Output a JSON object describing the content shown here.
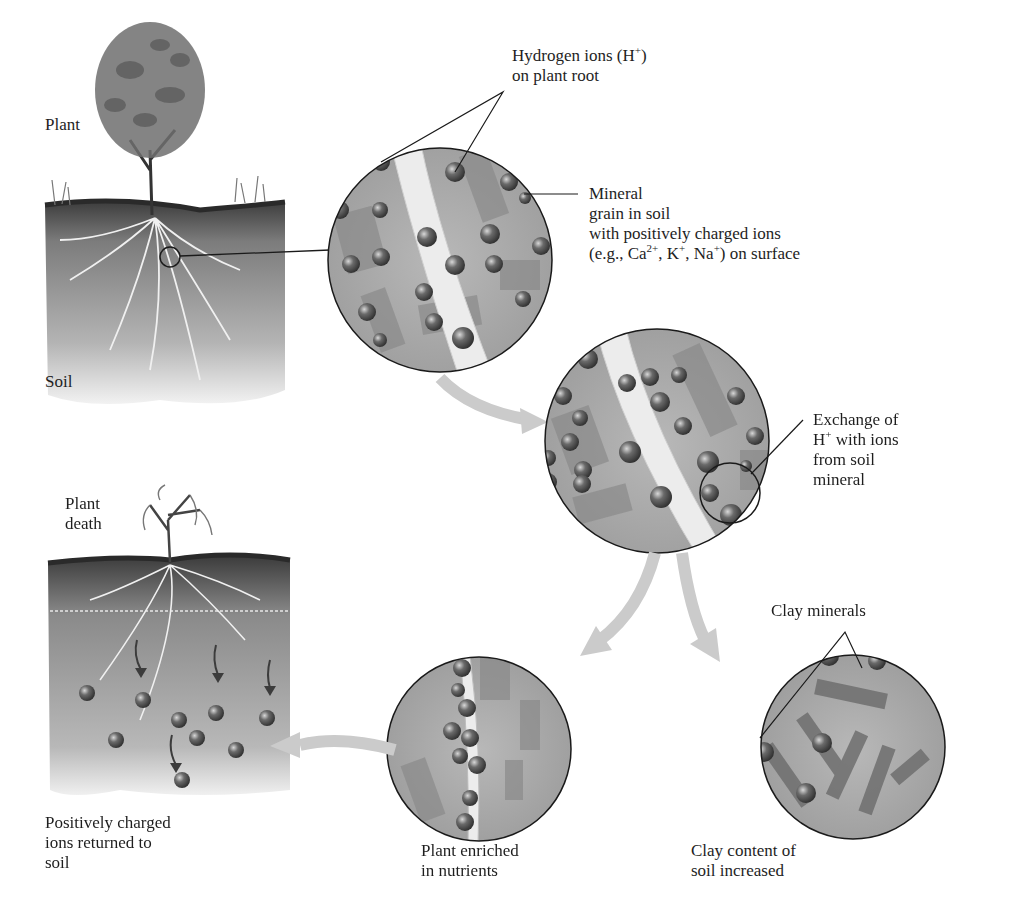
{
  "panels": {
    "plant": {
      "label": "Plant"
    },
    "soil": {
      "label": "Soil"
    },
    "hydrogen": {
      "line1": "Hydrogen ions (H",
      "sup1": "+",
      "line1_end": ")",
      "line2": "on plant root"
    },
    "mineral": {
      "line1": "Mineral",
      "line2": "grain in soil",
      "line3": "with positively charged ions",
      "line4_a": "(e.g., Ca",
      "sup_ca": "2+",
      "line4_b": ", K",
      "sup_k": "+",
      "line4_c": ", Na",
      "sup_na": "+",
      "line4_d": ") on surface"
    },
    "exchange": {
      "line1": "Exchange of",
      "line2_a": "H",
      "sup_h": "+",
      "line2_b": " with ions",
      "line3": "from soil",
      "line4": "mineral"
    },
    "plant_death": {
      "line1": "Plant",
      "line2": "death"
    },
    "returned": {
      "line1": "Positively charged",
      "line2": "ions returned to",
      "line3": "soil"
    },
    "enriched": {
      "line1": "Plant enriched",
      "line2": "in nutrients"
    },
    "clay_minerals": {
      "label": "Clay minerals"
    },
    "clay_increased": {
      "line1": "Clay content of",
      "line2": "soil increased"
    }
  },
  "colors": {
    "soil_dark": "#4a4a4a",
    "soil_mid": "#8c8c8c",
    "circle_fill": "#a9a9a9",
    "ion": "#5a5a5a",
    "arrow": "#c8c8c8"
  }
}
